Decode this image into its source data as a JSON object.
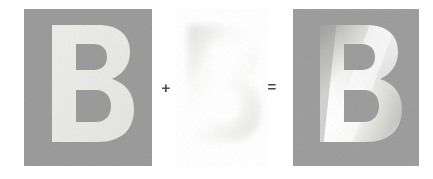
{
  "figure": {
    "type": "image-composition-diagram",
    "background_color": "#ffffff",
    "panels": [
      {
        "id": "base",
        "name": "flat-letter-panel",
        "glyph": "B",
        "background_color": "#9b9b9b",
        "glyph_color": "#e8e8e4",
        "glyph_fill_type": "flat",
        "x": 24,
        "y": 9,
        "width": 128,
        "height": 157
      },
      {
        "id": "shading",
        "name": "shading-layer-panel",
        "glyph": "B",
        "background_color": "#ffffff",
        "glyph_color": "#f2f2f0",
        "glyph_fill_type": "soft-noise-gradient",
        "x": 176,
        "y": 9,
        "width": 92,
        "height": 157
      },
      {
        "id": "result",
        "name": "shaded-letter-panel",
        "glyph": "B",
        "background_color": "#9b9b9b",
        "glyph_color": "#ffffff",
        "glyph_fill_type": "diagonal-emboss-gradient",
        "x": 293,
        "y": 9,
        "width": 126,
        "height": 157
      }
    ],
    "operators": [
      {
        "id": "plus",
        "name": "plus-operator",
        "symbol": "+",
        "color": "#4a4a4a",
        "x": 165,
        "y": 88
      },
      {
        "id": "equals",
        "name": "equals-operator",
        "symbol": "=",
        "color": "#4a4a4a",
        "x": 272,
        "y": 87
      }
    ],
    "colors": {
      "panel_gray": "#9b9b9b",
      "panel_gray_dark": "#949494",
      "flat_glyph": "#e8e8e4",
      "highlight": "#ffffff",
      "shade_dark": "#8f8f8f",
      "shade_mid": "#c9c9c5",
      "operator": "#4a4a4a",
      "page_background": "#ffffff"
    }
  }
}
